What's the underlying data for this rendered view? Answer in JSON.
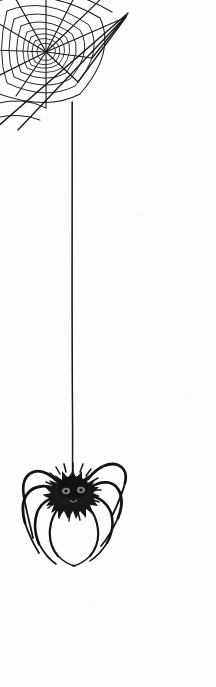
{
  "artwork": {
    "title": "Hanging Spider and Cobweb",
    "medium": "Black ink line drawing",
    "caption": "A black spider dangling on a long silk thread beneath a cobweb in the upper left corner",
    "canvas": {
      "width": 216,
      "height": 687,
      "background_color": "#fdfdfd"
    },
    "ink_color": "#141414",
    "web_line_color": "#1a1a1a",
    "thread_color": "#2a2a2a",
    "spider_body_color": "#171717",
    "spider_leg_color": "#121212"
  },
  "elements": {
    "cobweb": {
      "label": "Cobweb",
      "position": "top-left corner",
      "hub_x": 46,
      "hub_y": 52,
      "radial_spokes": 11,
      "concentric_rings": 7,
      "anchor_lines": 2
    },
    "silk_thread": {
      "label": "Silk thread",
      "x": 72,
      "top_y": 102,
      "bottom_y": 478,
      "length": 376
    },
    "spider": {
      "label": "Spider",
      "body_center_x": 73,
      "body_center_y": 490,
      "body_width": 46,
      "body_height": 38,
      "leg_count": 8,
      "eye_count": 2
    }
  }
}
